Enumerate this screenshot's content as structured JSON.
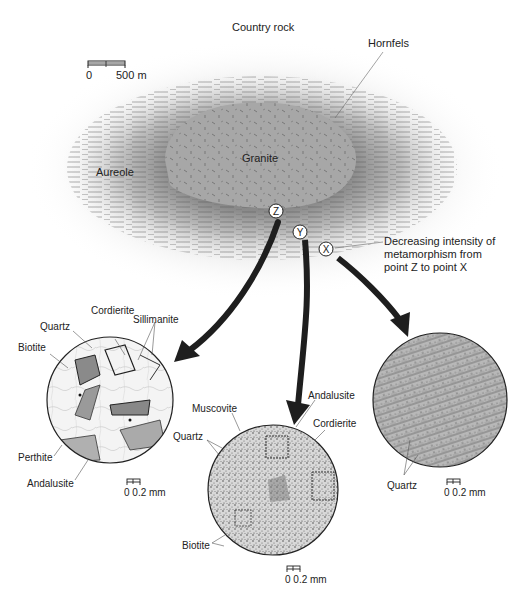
{
  "diagram": {
    "title_labels": {
      "country_rock": "Country rock",
      "hornfels": "Hornfels",
      "granite": "Granite",
      "aureole": "Aureole",
      "caption": [
        "Decreasing intensity of",
        "metamorphism from",
        "point Z to point X"
      ]
    },
    "map_scale": {
      "start": "0",
      "end": "500 m"
    },
    "points": [
      {
        "id": "Z",
        "x": 276,
        "y": 211
      },
      {
        "id": "Y",
        "x": 300,
        "y": 232
      },
      {
        "id": "X",
        "x": 326,
        "y": 249
      }
    ],
    "thin_sections": [
      {
        "point": "Z",
        "cx": 110,
        "cy": 400,
        "r": 63,
        "minerals": [
          "Cordierite",
          "Sillimanite",
          "Quartz",
          "Biotite",
          "Perthite",
          "Andalusite"
        ],
        "scale": {
          "start": "0",
          "end": "0.2 mm"
        }
      },
      {
        "point": "Y",
        "cx": 273,
        "cy": 490,
        "r": 65,
        "minerals": [
          "Andalusite",
          "Muscovite",
          "Cordierite",
          "Quartz",
          "Biotite"
        ],
        "scale": {
          "start": "0",
          "end": "0.2 mm"
        }
      },
      {
        "point": "X",
        "cx": 440,
        "cy": 400,
        "r": 67,
        "minerals": [
          "Quartz"
        ],
        "scale": {
          "start": "0",
          "end": "0.2 mm"
        }
      }
    ]
  },
  "labels": {
    "z_cordierite": "Cordierite",
    "z_sillimanite": "Sillimanite",
    "z_quartz": "Quartz",
    "z_biotite": "Biotite",
    "z_perthite": "Perthite",
    "z_andalusite": "Andalusite",
    "y_andalusite": "Andalusite",
    "y_muscovite": "Muscovite",
    "y_cordierite": "Cordierite",
    "y_quartz": "Quartz",
    "y_biotite": "Biotite",
    "x_quartz": "Quartz",
    "scale_z": "0  0.2 mm",
    "scale_y": "0  0.2 mm",
    "scale_x": "0  0.2 mm"
  },
  "colors": {
    "aureole_outer": "#e6e6e6",
    "aureole_inner": "#9a9a9a",
    "granite": "#a9a9a9",
    "arrow": "#1e1e1e",
    "text": "#222222"
  }
}
